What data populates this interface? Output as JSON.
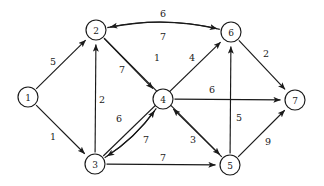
{
  "chart_data": {
    "type": "diagram",
    "subtype": "directed-weighted-graph",
    "title": "",
    "xlabel": "",
    "ylabel": "",
    "nodes": [
      {
        "id": "1",
        "label": "1",
        "x": 28,
        "y": 97,
        "r": 10
      },
      {
        "id": "2",
        "label": "2",
        "x": 96,
        "y": 30,
        "r": 10
      },
      {
        "id": "3",
        "label": "3",
        "x": 95,
        "y": 164,
        "r": 10
      },
      {
        "id": "4",
        "label": "4",
        "x": 163,
        "y": 99,
        "r": 10
      },
      {
        "id": "5",
        "label": "5",
        "x": 230,
        "y": 165,
        "r": 10
      },
      {
        "id": "6",
        "label": "6",
        "x": 231,
        "y": 32,
        "r": 10
      },
      {
        "id": "7",
        "label": "7",
        "x": 295,
        "y": 100,
        "r": 10
      }
    ],
    "edges": [
      {
        "from": "1",
        "to": "2",
        "weight": "5",
        "style": "straight",
        "lx": 53,
        "ly": 61
      },
      {
        "from": "1",
        "to": "3",
        "weight": "1",
        "style": "straight",
        "lx": 53,
        "ly": 136
      },
      {
        "from": "3",
        "to": "2",
        "weight": "2",
        "style": "straight",
        "lx": 102,
        "ly": 99
      },
      {
        "from": "2",
        "to": "6",
        "weight": "6",
        "style": "curve-up",
        "lx": 163,
        "ly": 13,
        "bend": -15
      },
      {
        "from": "6",
        "to": "2",
        "weight": "7",
        "style": "curve-down",
        "lx": 163,
        "ly": 36,
        "bend": -15
      },
      {
        "from": "2",
        "to": "4",
        "weight": "7",
        "style": "straight",
        "lx": 122,
        "ly": 69
      },
      {
        "from": "2",
        "to": "5",
        "weight": "1",
        "style": "straight",
        "lx": 157,
        "ly": 57
      },
      {
        "from": "3",
        "to": "6",
        "weight": "4",
        "style": "straight",
        "lx": 192,
        "ly": 57
      },
      {
        "from": "3",
        "to": "4",
        "weight": "6",
        "style": "curve-up",
        "lx": 119,
        "ly": 118,
        "bend": 9
      },
      {
        "from": "4",
        "to": "3",
        "weight": "7",
        "style": "curve-down",
        "lx": 146,
        "ly": 139,
        "bend": 9
      },
      {
        "from": "5",
        "to": "4",
        "weight": "3",
        "style": "straight",
        "lx": 193,
        "ly": 139
      },
      {
        "from": "3",
        "to": "5",
        "weight": "7",
        "style": "straight",
        "lx": 163,
        "ly": 157
      },
      {
        "from": "4",
        "to": "7",
        "weight": "6",
        "style": "straight",
        "lx": 212,
        "ly": 89
      },
      {
        "from": "5",
        "to": "6",
        "weight": "5",
        "style": "straight",
        "lx": 239,
        "ly": 117
      },
      {
        "from": "6",
        "to": "7",
        "weight": "2",
        "style": "straight",
        "lx": 266,
        "ly": 53
      },
      {
        "from": "5",
        "to": "7",
        "weight": "9",
        "style": "straight",
        "lx": 268,
        "ly": 141
      }
    ],
    "colors": {
      "stroke": "#1a1a1a",
      "node_fill": "#ffffff",
      "background": "#ffffff"
    },
    "legend": [],
    "annotations": []
  }
}
